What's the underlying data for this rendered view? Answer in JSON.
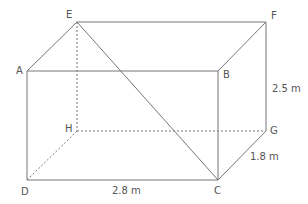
{
  "diagram": {
    "type": "cuboid",
    "line_color": "#777777",
    "text_color": "#555555",
    "vertices": {
      "A": {
        "label": "A",
        "x": 27,
        "y": 71
      },
      "B": {
        "label": "B",
        "x": 218,
        "y": 71
      },
      "C": {
        "label": "C",
        "x": 218,
        "y": 180
      },
      "D": {
        "label": "D",
        "x": 27,
        "y": 180
      },
      "E": {
        "label": "E",
        "x": 77,
        "y": 22
      },
      "F": {
        "label": "F",
        "x": 266,
        "y": 22
      },
      "G": {
        "label": "G",
        "x": 266,
        "y": 131
      },
      "H": {
        "label": "H",
        "x": 77,
        "y": 131
      }
    },
    "edges_solid": [
      [
        "A",
        "B"
      ],
      [
        "B",
        "C"
      ],
      [
        "C",
        "D"
      ],
      [
        "D",
        "A"
      ],
      [
        "E",
        "F"
      ],
      [
        "F",
        "G"
      ],
      [
        "A",
        "E"
      ],
      [
        "B",
        "F"
      ],
      [
        "C",
        "G"
      ]
    ],
    "edges_hidden": [
      [
        "E",
        "H"
      ],
      [
        "H",
        "G"
      ],
      [
        "D",
        "H"
      ]
    ],
    "diagonals": [
      [
        "E",
        "C"
      ]
    ],
    "dimensions": {
      "height": "2.5 m",
      "depth": "1.8 m",
      "length": "2.8 m"
    }
  }
}
